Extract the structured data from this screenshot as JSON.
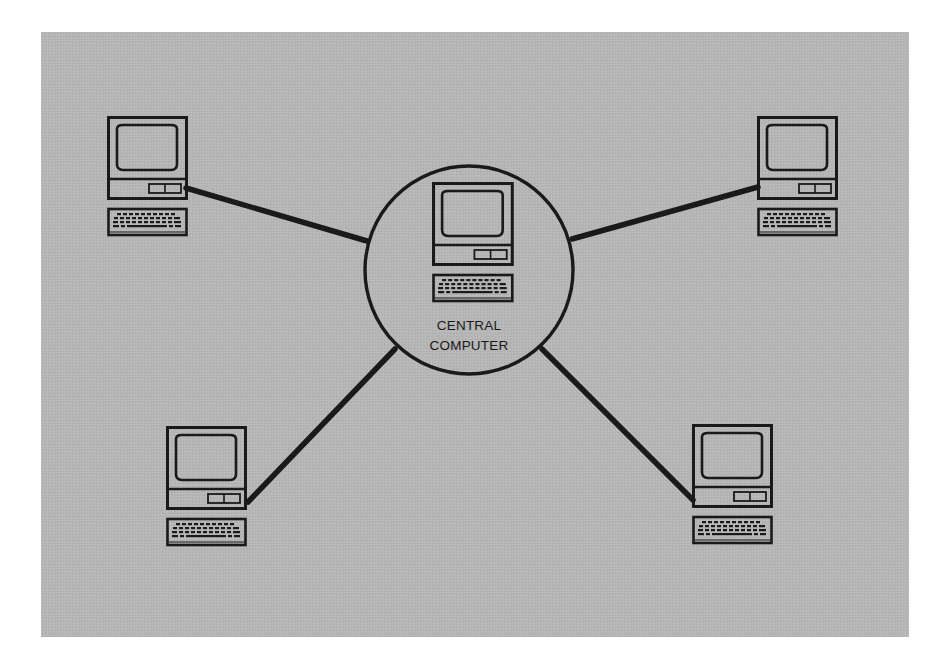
{
  "diagram": {
    "type": "star-network",
    "background_color": "#b5b5b5",
    "line_color": "#1a1a1a",
    "central_node": {
      "label_line1": "CENTRAL",
      "label_line2": "COMPUTER",
      "icon": "computer-terminal-icon"
    },
    "peripheral_nodes": [
      {
        "position": "top-left",
        "icon": "computer-terminal-icon"
      },
      {
        "position": "top-right",
        "icon": "computer-terminal-icon"
      },
      {
        "position": "bottom-left",
        "icon": "computer-terminal-icon"
      },
      {
        "position": "bottom-right",
        "icon": "computer-terminal-icon"
      }
    ],
    "connections": [
      {
        "from": "central",
        "to": "top-left"
      },
      {
        "from": "central",
        "to": "top-right"
      },
      {
        "from": "central",
        "to": "bottom-left"
      },
      {
        "from": "central",
        "to": "bottom-right"
      }
    ]
  }
}
